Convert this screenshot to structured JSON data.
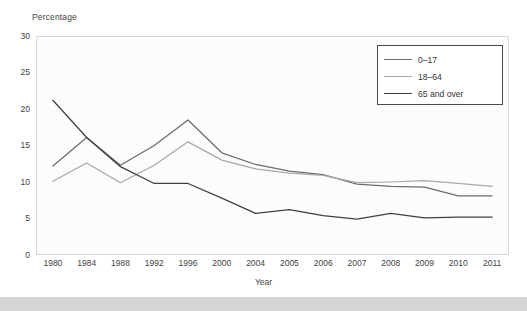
{
  "chart_data": {
    "type": "line",
    "title": "",
    "xlabel": "Year",
    "ylabel": "Percentage",
    "categories": [
      "1980",
      "1984",
      "1988",
      "1992",
      "1996",
      "2000",
      "2004",
      "2005",
      "2006",
      "2007",
      "2008",
      "2009",
      "2010",
      "2011"
    ],
    "yticks": [
      "0",
      "5",
      "10",
      "15",
      "20",
      "25",
      "30"
    ],
    "ylim": [
      0,
      30
    ],
    "grid": false,
    "legend_position": "top-right",
    "series": [
      {
        "name": "0–17",
        "color": "#6b6b6b",
        "values": [
          12.2,
          16.1,
          12.3,
          15.0,
          18.5,
          14.0,
          12.4,
          11.5,
          11.0,
          9.7,
          9.4,
          9.3,
          8.1,
          8.1
        ]
      },
      {
        "name": "18–64",
        "color": "#a8a8a8",
        "values": [
          10.1,
          12.6,
          9.9,
          12.3,
          15.5,
          13.0,
          11.8,
          11.2,
          10.9,
          9.9,
          10.0,
          10.2,
          9.8,
          9.4
        ]
      },
      {
        "name": "65 and over",
        "color": "#3f3f3f",
        "values": [
          21.2,
          16.1,
          12.1,
          9.8,
          9.8,
          7.8,
          5.7,
          6.2,
          5.4,
          4.9,
          5.7,
          5.1,
          5.2,
          5.2
        ]
      }
    ]
  },
  "legend": {
    "items": [
      {
        "label": "0–17"
      },
      {
        "label": "18–64"
      },
      {
        "label": "65 and over"
      }
    ]
  },
  "axes": {
    "y_axis_title": "Percentage",
    "x_axis_title": "Year"
  }
}
